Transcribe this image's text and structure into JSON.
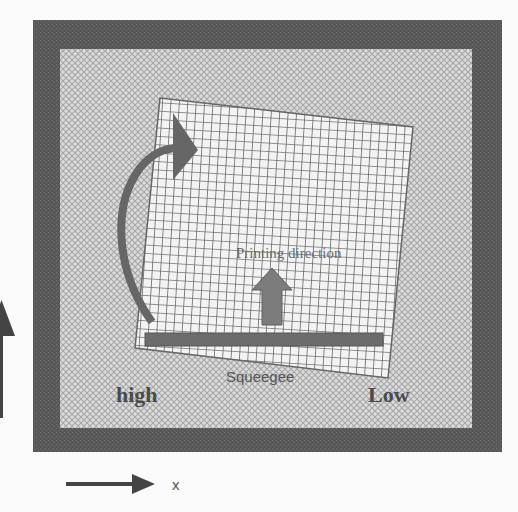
{
  "diagram": {
    "title": "",
    "labels": {
      "printing_direction": "Printing direction",
      "squeegee": "Squeegee",
      "high": "high",
      "low": "Low",
      "x_axis": "x",
      "y_axis": "y"
    },
    "colors": {
      "background": "#fafafa",
      "frame": "#5a5a5a",
      "hatch_bg": "#d9d9d9",
      "hatch_line": "#a8a8a8",
      "screen_bg": "#f2f2f2",
      "screen_grid": "#6e6e6e",
      "arrow": "#6a6a6a",
      "squeegee_bar": "#6c6c6c",
      "text": "#4a4a4a"
    },
    "elements": [
      "outer-frame",
      "hatched-substrate",
      "tilted-screen-mesh",
      "curved-rotation-arrow",
      "printing-direction-arrow",
      "squeegee-bar",
      "x-axis-arrow",
      "y-axis-arrow"
    ]
  }
}
